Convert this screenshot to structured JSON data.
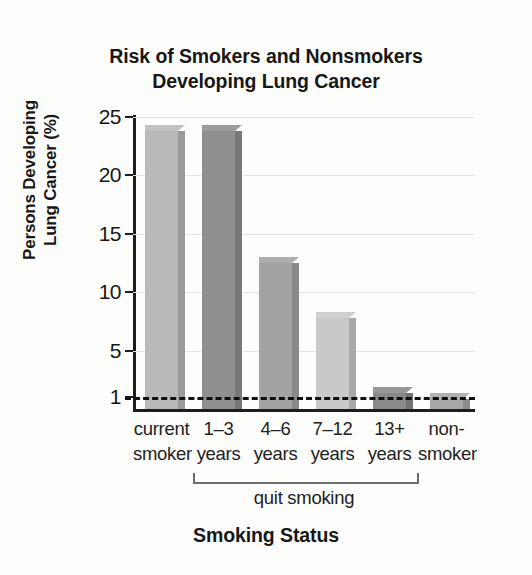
{
  "chart_data": {
    "type": "bar",
    "title": "Risk of Smokers and Nonsmokers Developing Lung Cancer",
    "title_lines": [
      "Risk of Smokers and Nonsmokers",
      "Developing Lung Cancer"
    ],
    "xlabel": "Smoking Status",
    "ylabel": "Persons Developing Lung Cancer (%)",
    "ylabel_lines": [
      "Persons Developing",
      "Lung Cancer (%)"
    ],
    "categories": [
      "current smoker",
      "1–3 years",
      "4–6 years",
      "7–12 years",
      "13+ years",
      "non-smoker"
    ],
    "category_lines": [
      [
        "current",
        "smoker"
      ],
      [
        "1–3",
        "years"
      ],
      [
        "4–6",
        "years"
      ],
      [
        "7–12",
        "years"
      ],
      [
        "13+",
        "years"
      ],
      [
        "non-",
        "smoker"
      ]
    ],
    "values": [
      23.8,
      23.8,
      12.5,
      7.8,
      1.4,
      0.9
    ],
    "bar_colors": [
      "#b9b9b9",
      "#8f8f8f",
      "#a3a3a3",
      "#c9c9c9",
      "#8a8a8a",
      "#a8a8a8"
    ],
    "ylim": [
      0,
      25
    ],
    "yticks": [
      25,
      20,
      15,
      10,
      5,
      1
    ],
    "ytick_labels": [
      "25",
      "20",
      "15",
      "10",
      "5",
      "1"
    ],
    "grid": true,
    "legend": "none",
    "reference_line": {
      "value": 1,
      "style": "dashed",
      "color": "#101010"
    },
    "annotations": [
      {
        "text": "quit smoking",
        "spans_categories": [
          "1–3 years",
          "4–6 years",
          "7–12 years",
          "13+ years"
        ],
        "type": "bracket"
      }
    ]
  }
}
